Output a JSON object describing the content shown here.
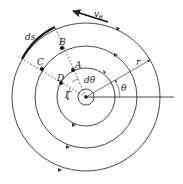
{
  "diagram": {
    "type": "concentric-streamlines-vortex",
    "center": {
      "x": 86,
      "y": 97
    },
    "circles": [
      {
        "name": "core",
        "r": 8
      },
      {
        "name": "inner",
        "r": 29
      },
      {
        "name": "middle",
        "r": 51
      },
      {
        "name": "outer",
        "r": 74
      }
    ],
    "points": [
      {
        "label": "A",
        "x": 73,
        "y": 70
      },
      {
        "label": "B",
        "x": 62,
        "y": 48
      },
      {
        "label": "C",
        "x": 42,
        "y": 69
      },
      {
        "label": "D",
        "x": 61,
        "y": 83
      }
    ],
    "labels": {
      "velocity": "v",
      "velocity_sub": "θ",
      "ds": "ds",
      "dtheta": "dθ",
      "r": "r",
      "theta": "θ",
      "gamma": "Γ",
      "A": "A",
      "B": "B",
      "C": "C",
      "D": "D"
    },
    "colors": {
      "line": "#333333",
      "background": "#ffffff"
    }
  }
}
